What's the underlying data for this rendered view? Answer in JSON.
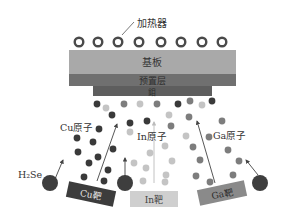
{
  "labels": {
    "heater": "加热器",
    "substrate": "基板",
    "precursor_layer": "预置层",
    "mo_layer": "鉬",
    "cu_atom": "Cu原子",
    "in_atom": "In原子",
    "ga_atom": "Ga原子",
    "h2se": "H₂Se",
    "cu_target": "Cu靶",
    "in_target": "In靶",
    "ga_target": "Ga靶"
  },
  "colors": {
    "substrate": "#a9a9a9",
    "precursor": "#6e6e6e",
    "cu_atom": "#3a3a3a",
    "in_atom": "#c4c4c4",
    "ga_atom": "#7d7d7d",
    "cu_target": "#3c3c3c",
    "in_target": "#cfcfcf",
    "ga_target": "#8a8a8a",
    "h2se_source": "#3e3e3e"
  },
  "heaters": {
    "count": 8
  }
}
